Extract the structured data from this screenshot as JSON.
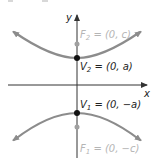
{
  "diagram": {
    "type": "hyperbola-vertical-transverse-axis",
    "colors": {
      "curve": "#8c8c8c",
      "axis": "#333333",
      "vertex": "#111111",
      "focus": "#a0a0a0",
      "focus_label": "#b5b5b5",
      "vertex_label": "#222222"
    },
    "axes": {
      "x_label": "x",
      "y_label": "y"
    },
    "points": {
      "F2": {
        "name": "F",
        "sub": "2",
        "label": " = (0, c)"
      },
      "V2": {
        "name": "V",
        "sub": "2",
        "label": " = (0, a)"
      },
      "V1": {
        "name": "V",
        "sub": "1",
        "label": " = (0, −a)"
      },
      "F1": {
        "name": "F",
        "sub": "1",
        "label": " = (0, −c)"
      }
    }
  }
}
